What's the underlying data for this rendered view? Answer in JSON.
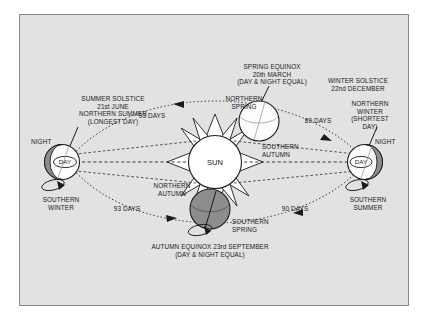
{
  "figure": {
    "title_sun": "SUN",
    "background_color": "#e2e2e2",
    "border_color": "#868686",
    "ink_color": "#1a1a1a",
    "earth_dark_color": "#8a8a8a",
    "earth_light_color": "#ffffff"
  },
  "annotations": {
    "summer_solstice": {
      "line1": "SUMMER SOLSTICE",
      "line2": "21st JUNE",
      "line3": "NORTHERN SUMMER",
      "line4": "(LONGEST DAY)"
    },
    "spring_equinox": {
      "line1": "SPRING EQUINOX",
      "line2": "20th MARCH",
      "line3": "(DAY & NIGHT EQUAL)"
    },
    "winter_solstice": {
      "line1": "WINTER SOLSTICE",
      "line2": "22nd DECEMBER"
    },
    "northern_winter": {
      "line1": "NORTHERN",
      "line2": "WINTER",
      "line3": "(SHORTEST",
      "line4": "DAY)"
    },
    "autumn_equinox": {
      "line1": "AUTUMN EQUINOX 23rd SEPTEMBER",
      "line2": "(DAY & NIGHT EQUAL)"
    },
    "northern_spring": {
      "line1": "NORTHERN",
      "line2": "SPRING"
    },
    "southern_autumn": {
      "line1": "SOUTHERN",
      "line2": "AUTUMN"
    },
    "northern_autumn": {
      "line1": "NORTHERN",
      "line2": "AUTUMN"
    },
    "southern_spring": {
      "line1": "SOUTHERN",
      "line2": "SPRING"
    },
    "southern_winter": {
      "line1": "SOUTHERN",
      "line2": "WINTER"
    },
    "southern_summer": {
      "line1": "SOUTHERN",
      "line2": "SUMMER"
    }
  },
  "globes": {
    "left": {
      "day": "DAY",
      "night": "NIGHT"
    },
    "right": {
      "day": "DAY",
      "night": "NIGHT"
    }
  },
  "durations": {
    "top_left": "93 DAYS",
    "top_right": "89 DAYS",
    "bottom_left": "93 DAYS",
    "bottom_right": "90 DAYS"
  },
  "diagram_data": {
    "type": "diagram",
    "subject": "Earth's seasons and orbit around the Sun",
    "center_body": "SUN",
    "orbit_style": "dotted ellipse, counter-clockwise travel",
    "stations": [
      {
        "position": "left",
        "event": "SUMMER SOLSTICE",
        "date": "21st JUNE",
        "northern_season": "NORTHERN SUMMER",
        "note": "(LONGEST DAY)",
        "southern_season": "SOUTHERN WINTER",
        "terminator": "night on left hemisphere, day on right hemisphere"
      },
      {
        "position": "top",
        "event": "SPRING EQUINOX",
        "date": "20th MARCH",
        "note": "(DAY & NIGHT EQUAL)",
        "northern_season": "NORTHERN SPRING",
        "southern_season": "SOUTHERN AUTUMN",
        "terminator": "fully lit face toward viewer"
      },
      {
        "position": "right",
        "event": "WINTER SOLSTICE",
        "date": "22nd DECEMBER",
        "northern_season": "NORTHERN WINTER",
        "note": "(SHORTEST DAY)",
        "southern_season": "SOUTHERN SUMMER",
        "terminator": "day on left hemisphere, night on right hemisphere"
      },
      {
        "position": "bottom",
        "event": "AUTUMN EQUINOX",
        "date": "23rd SEPTEMBER",
        "note": "(DAY & NIGHT EQUAL)",
        "northern_season": "NORTHERN AUTUMN",
        "southern_season": "SOUTHERN SPRING",
        "terminator": "dark face toward viewer"
      }
    ],
    "segment_durations": [
      {
        "from": "WINTER SOLSTICE",
        "to": "SPRING EQUINOX",
        "days": 89,
        "label": "89 DAYS"
      },
      {
        "from": "SPRING EQUINOX",
        "to": "SUMMER SOLSTICE",
        "days": 93,
        "label": "93 DAYS"
      },
      {
        "from": "SUMMER SOLSTICE",
        "to": "AUTUMN EQUINOX",
        "days": 93,
        "label": "93 DAYS"
      },
      {
        "from": "AUTUMN EQUINOX",
        "to": "WINTER SOLSTICE",
        "days": 90,
        "label": "90 DAYS"
      }
    ]
  }
}
